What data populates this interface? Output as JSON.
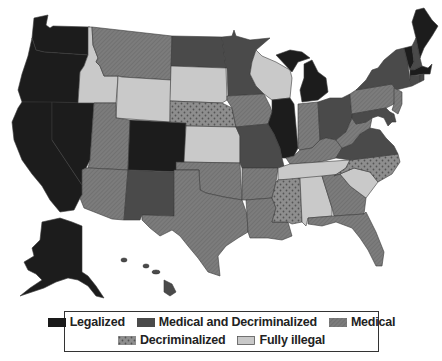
{
  "map": {
    "title": "US marijuana legal status by state",
    "categories": {
      "legalized": {
        "label": "Legalized",
        "color": "#1a1a1a",
        "pattern": "solid"
      },
      "med_decrim": {
        "label": "Medical and Decriminalized",
        "color": "#4a4a4a",
        "pattern": "solid"
      },
      "medical": {
        "label": "Medical",
        "color": "#7a7a7a",
        "pattern": "hatched"
      },
      "decrim": {
        "label": "Decriminalized",
        "color": "#8a8a8a",
        "pattern": "dotted"
      },
      "illegal": {
        "label": "Fully illegal",
        "color": "#c8c8c8",
        "pattern": "solid"
      }
    },
    "states": {
      "WA": "legalized",
      "OR": "legalized",
      "CA": "legalized",
      "NV": "legalized",
      "AK": "legalized",
      "CO": "legalized",
      "IL": "legalized",
      "MI": "legalized",
      "MA": "legalized",
      "VT": "legalized",
      "ME": "legalized",
      "MT": "medical",
      "ID": "illegal",
      "WY": "illegal",
      "UT": "medical",
      "AZ": "medical",
      "NM": "med_decrim",
      "ND": "med_decrim",
      "SD": "illegal",
      "NE": "decrim",
      "KS": "illegal",
      "OK": "medical",
      "TX": "medical",
      "MN": "med_decrim",
      "IA": "medical",
      "MO": "med_decrim",
      "AR": "medical",
      "LA": "medical",
      "WI": "illegal",
      "IN": "medical",
      "OH": "med_decrim",
      "KY": "medical",
      "TN": "illegal",
      "MS": "decrim",
      "AL": "illegal",
      "GA": "medical",
      "FL": "medical",
      "SC": "illegal",
      "NC": "decrim",
      "VA": "med_decrim",
      "WV": "medical",
      "PA": "medical",
      "NY": "med_decrim",
      "NJ": "medical",
      "DE": "med_decrim",
      "MD": "med_decrim",
      "CT": "med_decrim",
      "RI": "med_decrim",
      "NH": "med_decrim",
      "HI": "med_decrim"
    }
  },
  "legend": {
    "row1": [
      {
        "key": "legalized",
        "label": "Legalized"
      },
      {
        "key": "med_decrim",
        "label": "Medical and Decriminalized"
      },
      {
        "key": "medical",
        "label": "Medical"
      }
    ],
    "row2": [
      {
        "key": "decrim",
        "label": "Decriminalized"
      },
      {
        "key": "illegal",
        "label": "Fully illegal"
      }
    ]
  }
}
